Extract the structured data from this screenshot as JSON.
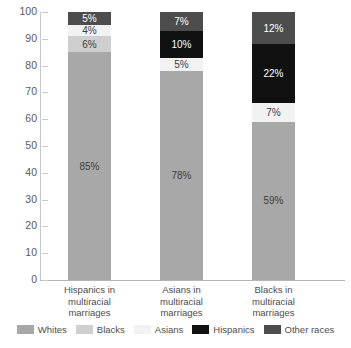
{
  "chart_data": {
    "type": "bar",
    "stacked": true,
    "title": "",
    "subtitle": "",
    "xlabel": "",
    "ylabel": "",
    "ylim": [
      0,
      100
    ],
    "yticks": [
      0,
      10,
      20,
      30,
      40,
      50,
      60,
      70,
      80,
      90,
      100
    ],
    "ytick_labels": [
      "0",
      "10",
      "20",
      "30",
      "40",
      "50",
      "60",
      "70",
      "80",
      "90",
      "100"
    ],
    "grid": false,
    "legend_position": "bottom",
    "categories": [
      "Hispanics in multiracial marriages",
      "Asians in multiracial marriages",
      "Blacks in multiracial marriages"
    ],
    "series": [
      {
        "name": "Whites",
        "color": "#a8a8a8",
        "values": [
          85,
          78,
          59
        ]
      },
      {
        "name": "Blacks",
        "color": "#cfcfcf",
        "values": [
          6,
          0,
          0
        ]
      },
      {
        "name": "Asians",
        "color": "#f2f2f2",
        "values": [
          4,
          5,
          7
        ]
      },
      {
        "name": "Hispanics",
        "color": "#111111",
        "values": [
          0,
          10,
          22
        ]
      },
      {
        "name": "Other races",
        "color": "#4d4d4d",
        "values": [
          5,
          7,
          12
        ]
      }
    ],
    "data_labels": [
      [
        "85%",
        "6%",
        "4%",
        "",
        "5%"
      ],
      [
        "78%",
        "",
        "5%",
        "10%",
        "7%"
      ],
      [
        "59%",
        "",
        "7%",
        "22%",
        "12%"
      ]
    ]
  },
  "axis": {
    "y_ticks": [
      {
        "label": "100",
        "value": 100
      },
      {
        "label": "90",
        "value": 90
      },
      {
        "label": "80",
        "value": 80
      },
      {
        "label": "70",
        "value": 70
      },
      {
        "label": "60",
        "value": 60
      },
      {
        "label": "50",
        "value": 50
      },
      {
        "label": "40",
        "value": 40
      },
      {
        "label": "30",
        "value": 30
      },
      {
        "label": "20",
        "value": 20
      },
      {
        "label": "10",
        "value": 10
      },
      {
        "label": "0",
        "value": 0
      }
    ]
  },
  "categories": [
    {
      "line1": "Hispanics in",
      "line2": "multiracial",
      "line3": "marriages"
    },
    {
      "line1": "Asians in",
      "line2": "multiracial",
      "line3": "marriages"
    },
    {
      "line1": "Blacks in",
      "line2": "multiracial",
      "line3": "marriages"
    }
  ],
  "legend": [
    {
      "label": "Whites",
      "color": "#a8a8a8"
    },
    {
      "label": "Blacks",
      "color": "#cfcfcf"
    },
    {
      "label": "Asians",
      "color": "#f2f2f2"
    },
    {
      "label": "Hispanics",
      "color": "#111111"
    },
    {
      "label": "Other races",
      "color": "#4d4d4d"
    }
  ]
}
